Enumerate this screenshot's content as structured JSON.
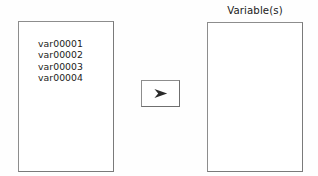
{
  "dialog": {
    "background_color": "#fefefe",
    "border_color": "#8d8d8d",
    "text_color": "#1b1b1b"
  },
  "source_list": {
    "name": "source-variable-list",
    "items": [
      {
        "label": "var00001"
      },
      {
        "label": "var00002"
      },
      {
        "label": "var00003"
      },
      {
        "label": "var00004"
      }
    ]
  },
  "transfer_button": {
    "icon": "right-arrow-icon",
    "label": "➤",
    "tooltip": "Move selected variables"
  },
  "target_list": {
    "name": "target-variable-list",
    "label": "Variable(s)",
    "items": []
  }
}
